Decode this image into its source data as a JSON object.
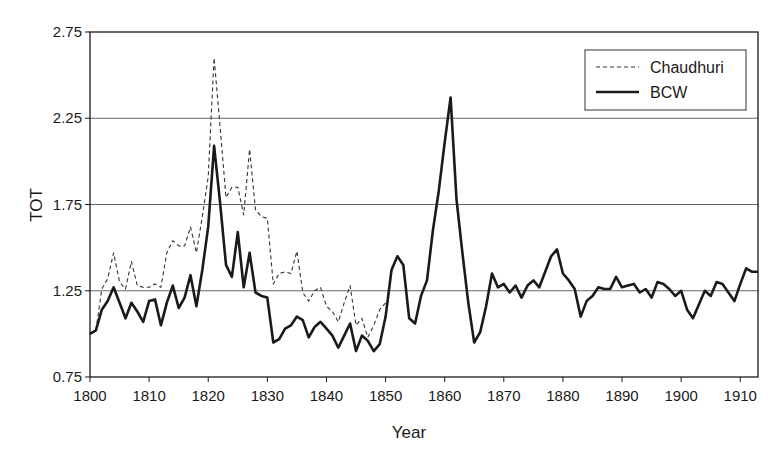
{
  "chart_data": {
    "type": "line",
    "title": "",
    "xlabel": "Year",
    "ylabel": "TOT",
    "xlim": [
      1800,
      1913
    ],
    "ylim": [
      0.75,
      2.75
    ],
    "x_ticks": [
      1800,
      1810,
      1820,
      1830,
      1840,
      1850,
      1860,
      1870,
      1880,
      1890,
      1900,
      1910
    ],
    "y_ticks": [
      "0.75",
      "1.25",
      "1.75",
      "2.25",
      "2.75"
    ],
    "grid": {
      "horizontal": true,
      "vertical": false,
      "lines_at": [
        1.25,
        1.75,
        2.25
      ]
    },
    "legend": {
      "position": "upper right",
      "entries": [
        "Chaudhuri",
        "BCW"
      ]
    },
    "series": [
      {
        "name": "Chaudhuri",
        "style": "dashed",
        "color": "#333333",
        "x": [
          1800,
          1801,
          1802,
          1803,
          1804,
          1805,
          1806,
          1807,
          1808,
          1809,
          1810,
          1811,
          1812,
          1813,
          1814,
          1815,
          1816,
          1817,
          1818,
          1819,
          1820,
          1821,
          1822,
          1823,
          1824,
          1825,
          1826,
          1827,
          1828,
          1829,
          1830,
          1831,
          1832,
          1833,
          1834,
          1835,
          1836,
          1837,
          1838,
          1839,
          1840,
          1841,
          1842,
          1843,
          1844,
          1845,
          1846,
          1847,
          1848,
          1849,
          1850
        ],
        "values": [
          1.0,
          1.02,
          1.26,
          1.32,
          1.47,
          1.3,
          1.26,
          1.42,
          1.28,
          1.27,
          1.27,
          1.29,
          1.27,
          1.47,
          1.54,
          1.51,
          1.51,
          1.62,
          1.47,
          1.68,
          1.91,
          2.6,
          2.2,
          1.79,
          1.85,
          1.85,
          1.69,
          2.07,
          1.72,
          1.68,
          1.67,
          1.29,
          1.35,
          1.36,
          1.35,
          1.48,
          1.24,
          1.19,
          1.25,
          1.27,
          1.16,
          1.13,
          1.07,
          1.18,
          1.28,
          1.05,
          1.09,
          0.98,
          1.05,
          1.14,
          1.18
        ]
      },
      {
        "name": "BCW",
        "style": "solid",
        "color": "#1a1a1a",
        "x": [
          1800,
          1801,
          1802,
          1803,
          1804,
          1805,
          1806,
          1807,
          1808,
          1809,
          1810,
          1811,
          1812,
          1813,
          1814,
          1815,
          1816,
          1817,
          1818,
          1819,
          1820,
          1821,
          1822,
          1823,
          1824,
          1825,
          1826,
          1827,
          1828,
          1829,
          1830,
          1831,
          1832,
          1833,
          1834,
          1835,
          1836,
          1837,
          1838,
          1839,
          1840,
          1841,
          1842,
          1843,
          1844,
          1845,
          1846,
          1847,
          1848,
          1849,
          1850,
          1851,
          1852,
          1853,
          1854,
          1855,
          1856,
          1857,
          1858,
          1859,
          1860,
          1861,
          1862,
          1863,
          1864,
          1865,
          1866,
          1867,
          1868,
          1869,
          1870,
          1871,
          1872,
          1873,
          1874,
          1875,
          1876,
          1877,
          1878,
          1879,
          1880,
          1881,
          1882,
          1883,
          1884,
          1885,
          1886,
          1887,
          1888,
          1889,
          1890,
          1891,
          1892,
          1893,
          1894,
          1895,
          1896,
          1897,
          1898,
          1899,
          1900,
          1901,
          1902,
          1903,
          1904,
          1905,
          1906,
          1907,
          1908,
          1909,
          1910,
          1911,
          1912,
          1913
        ],
        "values": [
          1.0,
          1.02,
          1.14,
          1.19,
          1.27,
          1.18,
          1.09,
          1.18,
          1.13,
          1.07,
          1.19,
          1.2,
          1.05,
          1.18,
          1.28,
          1.15,
          1.21,
          1.34,
          1.16,
          1.37,
          1.62,
          2.09,
          1.76,
          1.4,
          1.33,
          1.59,
          1.27,
          1.47,
          1.24,
          1.22,
          1.21,
          0.95,
          0.97,
          1.03,
          1.05,
          1.1,
          1.08,
          0.98,
          1.04,
          1.07,
          1.03,
          0.99,
          0.92,
          0.99,
          1.06,
          0.9,
          0.99,
          0.96,
          0.9,
          0.94,
          1.1,
          1.37,
          1.45,
          1.4,
          1.09,
          1.06,
          1.22,
          1.31,
          1.6,
          1.83,
          2.11,
          2.37,
          1.78,
          1.47,
          1.18,
          0.95,
          1.01,
          1.16,
          1.35,
          1.27,
          1.29,
          1.24,
          1.28,
          1.21,
          1.28,
          1.31,
          1.27,
          1.36,
          1.45,
          1.49,
          1.35,
          1.31,
          1.26,
          1.1,
          1.19,
          1.22,
          1.27,
          1.26,
          1.26,
          1.33,
          1.27,
          1.28,
          1.29,
          1.24,
          1.26,
          1.21,
          1.3,
          1.29,
          1.26,
          1.22,
          1.25,
          1.14,
          1.09,
          1.17,
          1.25,
          1.22,
          1.3,
          1.29,
          1.24,
          1.19,
          1.29,
          1.38,
          1.36,
          1.36
        ]
      }
    ]
  },
  "labels": {
    "xlabel": "Year",
    "ylabel": "TOT",
    "legend_chaudhuri": "Chaudhuri",
    "legend_bcw": "BCW"
  }
}
